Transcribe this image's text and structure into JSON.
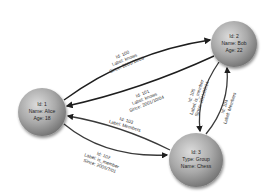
{
  "diagram": {
    "type": "property-graph",
    "nodes": [
      {
        "key": "alice",
        "cx": 42,
        "cy": 112,
        "r": 24,
        "lines": [
          "Id: 1",
          "Name: Alice",
          "Age: 18"
        ]
      },
      {
        "key": "bob",
        "cx": 234,
        "cy": 44,
        "r": 23,
        "lines": [
          "Id: 2",
          "Name: Bob",
          "Age: 22"
        ]
      },
      {
        "key": "chess",
        "cx": 196,
        "cy": 160,
        "r": 27,
        "lines": [
          "Id: 3",
          "Type: Group",
          "Name: Chess"
        ]
      }
    ],
    "edges": [
      {
        "key": "e100",
        "from": "alice",
        "to": "bob",
        "lines": [
          "Id: 100",
          "Label: knows",
          "Since: 2001/10/03"
        ]
      },
      {
        "key": "e101",
        "from": "bob",
        "to": "alice",
        "lines": [
          "Id: 101",
          "Label: knows",
          "Since: 2001/10/04"
        ]
      },
      {
        "key": "e102",
        "from": "alice",
        "to": "chess",
        "lines": [
          "Id: 102",
          "Label: is_member",
          "Since: 2005/7/01"
        ]
      },
      {
        "key": "e103",
        "from": "chess",
        "to": "alice",
        "lines": [
          "Id: 103",
          "Label: Members"
        ]
      },
      {
        "key": "e104",
        "from": "chess",
        "to": "bob",
        "lines": [
          "Id: 104",
          "Label: Members"
        ]
      },
      {
        "key": "e105",
        "from": "bob",
        "to": "chess",
        "lines": [
          "Id: 105",
          "Label: is_member",
          "Since: 2011/02/14"
        ]
      }
    ]
  },
  "colors": {
    "node_light": "#e2e2e2",
    "node_mid": "#a8a8a8",
    "node_dark": "#6e6e6e",
    "edge": "#1e1e1e",
    "text": "#222222"
  }
}
